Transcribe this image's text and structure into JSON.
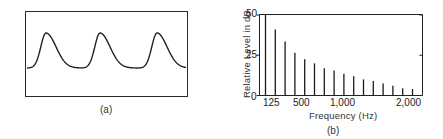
{
  "panels": {
    "a": {
      "label": "(a)",
      "description": "Periodic pulse waveform with three peaks"
    },
    "b": {
      "label": "(b)"
    }
  },
  "chart_data": [
    {
      "type": "line",
      "title": "(a)",
      "xlabel": "",
      "ylabel": "",
      "grid": false,
      "series": [
        {
          "name": "waveform",
          "periods": 3,
          "description": "Periodic asymmetric pulses: fast rise, slower decay, flat baseline between pulses"
        }
      ]
    },
    {
      "type": "bar",
      "title": "(b)",
      "xlabel": "Frequency (Hz)",
      "ylabel": "Relative Level in dB",
      "ylim": [
        0,
        50
      ],
      "yticks": [
        0,
        25,
        50
      ],
      "ytick_labels": [
        "0",
        "25",
        "50"
      ],
      "xtick_labels": [
        "125",
        "500",
        "1,000",
        "2,000"
      ],
      "grid": false,
      "categories": [
        125,
        250,
        375,
        500,
        625,
        750,
        875,
        1000,
        1125,
        1250,
        1375,
        1500,
        1625,
        1750,
        1875,
        2000
      ],
      "values": [
        50,
        41,
        33.5,
        26.5,
        22.5,
        20,
        17,
        15.5,
        13.5,
        12,
        10,
        9,
        7.5,
        6,
        4.5,
        4
      ]
    }
  ]
}
